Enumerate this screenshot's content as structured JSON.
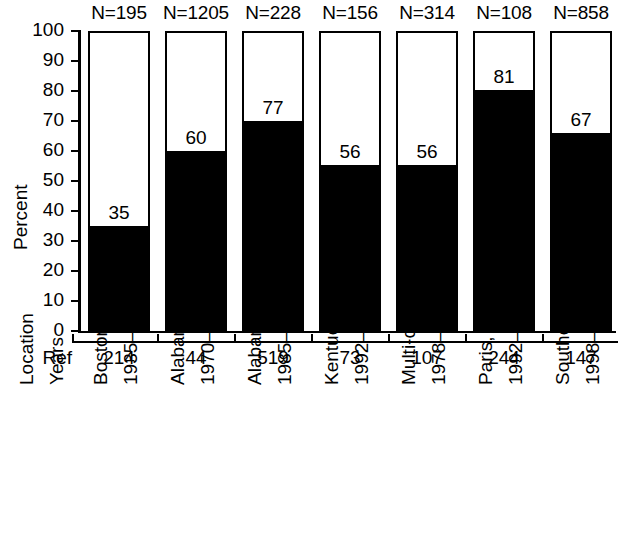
{
  "chart_data": {
    "type": "bar",
    "title": "",
    "subtitle": "",
    "xlabel": "",
    "ylabel": "Percent",
    "ylim": [
      0,
      100
    ],
    "ytick_labels": [
      "100",
      "90",
      "80",
      "70",
      "60",
      "50",
      "40",
      "30",
      "20",
      "10",
      "0"
    ],
    "ytick_values": [
      100,
      90,
      80,
      70,
      60,
      50,
      40,
      30,
      20,
      10,
      0
    ],
    "grid": false,
    "legend": "none",
    "bar_fill_color": "#000000",
    "bar_outline_color": "#000000",
    "bar_background_color": "#ffffff",
    "categories": [
      "Boston, USA 1935–74",
      "Alabama, USA 1970–77",
      "Alabama, USA 1985–89",
      "Kentucky, USA 1992–4",
      "Multi-center, USA 1978–94",
      "Paris, France 1992–7",
      "Southern Israel 1998–9"
    ],
    "values": [
      35,
      60,
      77,
      56,
      56,
      81,
      67
    ],
    "bar_filled_percent": [
      35,
      60,
      70,
      55.5,
      55.5,
      80.5,
      66
    ],
    "value_labels": [
      "35",
      "60",
      "77",
      "56",
      "56",
      "81",
      "67"
    ],
    "annotations": {
      "n_labels": [
        "N=195",
        "N=1205",
        "N=228",
        "N=156",
        "N=314",
        "N=108",
        "N=858"
      ],
      "n_values": [
        195,
        1205,
        228,
        156,
        314,
        108,
        858
      ],
      "ref_row_header": "Ref",
      "ref_labels": [
        "214",
        "44",
        "519",
        "73",
        "107",
        "244",
        "147"
      ],
      "ref_values": [
        214,
        44,
        519,
        73,
        107,
        244,
        147
      ],
      "location_row_header": "Location",
      "years_row_header": "Years",
      "locations": [
        "Boston, USA",
        "Alabama, USA",
        "Alabama, USA",
        "Kentucky, USA",
        "Multi-center, USA",
        "Paris, France",
        "Southern Israel"
      ],
      "years": [
        "1935–74",
        "1970–77",
        "1985–89",
        "1992–4",
        "1978–94",
        "1992–7",
        "1998–9"
      ]
    }
  }
}
